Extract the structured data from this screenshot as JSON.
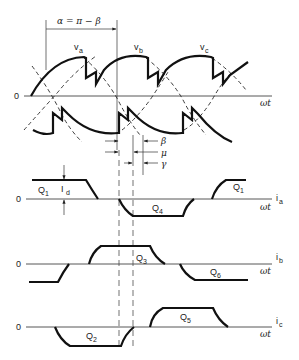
{
  "figure": {
    "angle_label": "α = π − β",
    "voltage_panel": {
      "zero_label": "0",
      "axis_label": "ωt",
      "phase_labels": [
        "v_a",
        "v_b",
        "v_c"
      ],
      "phase_labels_display": {
        "a": "v",
        "a_sub": "a",
        "b": "v",
        "b_sub": "b",
        "c": "v",
        "c_sub": "c"
      }
    },
    "angle_markers": {
      "beta": "β",
      "mu": "μ",
      "gamma": "γ"
    },
    "current_panels": [
      {
        "name": "i_a",
        "zero_label": "0",
        "signal_label": "i",
        "signal_sub": "a",
        "axis_label": "ωt",
        "dc_label": "I",
        "dc_sub": "d",
        "segments": [
          {
            "label": "Q",
            "sub": "1",
            "polarity": "positive"
          },
          {
            "label": "Q",
            "sub": "4",
            "polarity": "negative"
          },
          {
            "label": "Q",
            "sub": "1",
            "polarity": "positive"
          }
        ]
      },
      {
        "name": "i_b",
        "zero_label": "0",
        "signal_label": "i",
        "signal_sub": "b",
        "axis_label": "ωt",
        "segments": [
          {
            "label": "Q",
            "sub": "3",
            "polarity": "positive"
          },
          {
            "label": "Q",
            "sub": "6",
            "polarity": "negative"
          }
        ]
      },
      {
        "name": "i_c",
        "zero_label": "0",
        "signal_label": "i",
        "signal_sub": "c",
        "axis_label": "ωt",
        "segments": [
          {
            "label": "Q",
            "sub": "2",
            "polarity": "negative"
          },
          {
            "label": "Q",
            "sub": "5",
            "polarity": "positive"
          }
        ]
      }
    ],
    "colors": {
      "ink": "#111111",
      "background": "#ffffff"
    }
  }
}
